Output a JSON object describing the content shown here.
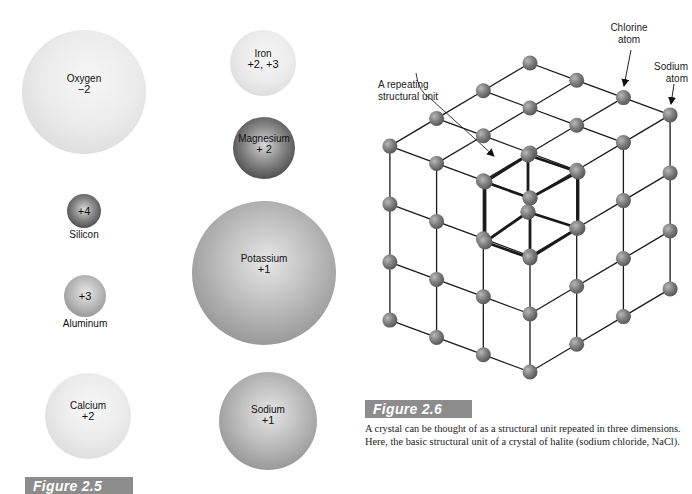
{
  "figure_2_5": {
    "label": "Figure 2.5",
    "ions": [
      {
        "id": "oxygen",
        "name": "Oxygen",
        "charge": "−2",
        "cx": 84,
        "cy": 92,
        "r": 62,
        "shade": "light",
        "label_position": "inside"
      },
      {
        "id": "iron",
        "name": "Iron",
        "charge": "+2, +3",
        "cx": 263,
        "cy": 63,
        "r": 33,
        "shade": "light",
        "label_position": "inside"
      },
      {
        "id": "magnesium",
        "name": "Magnesium",
        "charge": "+ 2",
        "cx": 264,
        "cy": 148,
        "r": 31,
        "shade": "dark",
        "label_position": "inside"
      },
      {
        "id": "silicon",
        "name": "Silicon",
        "charge": "+4",
        "cx": 84,
        "cy": 211,
        "r": 17,
        "shade": "dark",
        "label_position": "below"
      },
      {
        "id": "potassium",
        "name": "Potassium",
        "charge": "+1",
        "cx": 264,
        "cy": 273,
        "r": 72,
        "shade": "medium",
        "label_position": "inside"
      },
      {
        "id": "aluminum",
        "name": "Aluminum",
        "charge": "+3",
        "cx": 85,
        "cy": 296,
        "r": 21,
        "shade": "medium",
        "label_position": "below"
      },
      {
        "id": "calcium",
        "name": "Calcium",
        "charge": "+2",
        "cx": 88,
        "cy": 416,
        "r": 43,
        "shade": "light",
        "label_position": "inside"
      },
      {
        "id": "sodium",
        "name": "Sodium",
        "charge": "+1",
        "cx": 268,
        "cy": 421,
        "r": 49,
        "shade": "medium",
        "label_position": "inside"
      }
    ]
  },
  "figure_2_6": {
    "label": "Figure 2.6",
    "caption": "A crystal can be thought of as a structural unit repeated in three dimensions. Here, the basic structural unit of a crystal of halite (sodium chloride, NaCl).",
    "annotations": {
      "chlorine": "Chlorine atom",
      "chlorine_line1": "Chlorine",
      "chlorine_line2": "atom",
      "sodium_line1": "Sodium",
      "sodium_line2": "atom",
      "unit_line1": "A repeating",
      "unit_line2": "structural unit"
    },
    "lattice": {
      "size": 4,
      "origin": [
        530,
        198
      ],
      "left_step": [
        -46.7,
        -17.3
      ],
      "right_step": [
        46.7,
        -27.7
      ],
      "down_step": [
        0,
        58
      ],
      "atom_radius": 7.5,
      "atom_color": "#7a7a7a",
      "edge_color": "#1a1a1a",
      "unit_cube_vertices": [
        [
          485,
          182
        ],
        [
          528,
          155
        ],
        [
          578,
          172
        ],
        [
          530,
          198
        ],
        [
          485,
          242
        ],
        [
          528,
          212
        ],
        [
          578,
          228
        ],
        [
          530,
          258
        ]
      ]
    }
  },
  "colors": {
    "figure_label_bg": "#8c8c8c",
    "figure_label_text": "#ffffff",
    "text": "#111111"
  }
}
